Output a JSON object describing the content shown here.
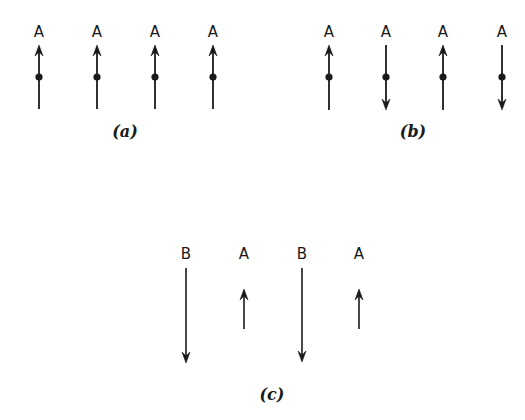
{
  "figure": {
    "panels": [
      {
        "id": "a",
        "caption": "(a)",
        "caption_pos": [
          125,
          137
        ],
        "spins": [
          {
            "label": "A",
            "x": 39,
            "direction": "up",
            "dot": true
          },
          {
            "label": "A",
            "x": 97,
            "direction": "up",
            "dot": true
          },
          {
            "label": "A",
            "x": 155,
            "direction": "up",
            "dot": true
          },
          {
            "label": "A",
            "x": 213,
            "direction": "up",
            "dot": true
          }
        ],
        "label_y": 37,
        "arrow_top": 45,
        "arrow_bottom": 109,
        "dot_y": 77
      },
      {
        "id": "b",
        "caption": "(b)",
        "caption_pos": [
          413,
          137
        ],
        "spins": [
          {
            "label": "A",
            "x": 329,
            "direction": "up",
            "dot": true
          },
          {
            "label": "A",
            "x": 386,
            "direction": "down",
            "dot": true
          },
          {
            "label": "A",
            "x": 443,
            "direction": "up",
            "dot": true
          },
          {
            "label": "A",
            "x": 502,
            "direction": "down",
            "dot": true
          }
        ],
        "label_y": 37,
        "arrow_top": 45,
        "arrow_bottom": 110,
        "dot_y": 77
      },
      {
        "id": "c",
        "caption": "(c)",
        "caption_pos": [
          272,
          400
        ],
        "spins": [
          {
            "label": "B",
            "x": 186,
            "direction": "down",
            "dot": false,
            "top": 268,
            "bottom": 363
          },
          {
            "label": "A",
            "x": 244,
            "direction": "up",
            "dot": false,
            "top": 289,
            "bottom": 329
          },
          {
            "label": "B",
            "x": 302,
            "direction": "down",
            "dot": false,
            "top": 268,
            "bottom": 362
          },
          {
            "label": "A",
            "x": 359,
            "direction": "up",
            "dot": false,
            "top": 289,
            "bottom": 329
          }
        ],
        "label_y": 259
      }
    ],
    "colors": {
      "ink": "#1a1a1a",
      "background": "#ffffff"
    }
  }
}
